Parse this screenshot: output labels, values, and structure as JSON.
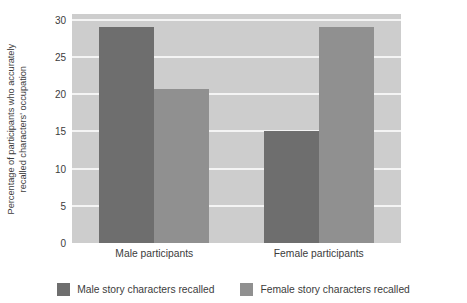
{
  "chart_data": {
    "type": "bar",
    "title": "",
    "xlabel": "",
    "ylabel_line1": "Percentage of participants who accurately",
    "ylabel_line2": "recalled characters' occupation",
    "categories": [
      "Male participants",
      "Female participants"
    ],
    "series": [
      {
        "name": "Male story characters recalled",
        "values": [
          29,
          15
        ],
        "color": "#6e6e6e"
      },
      {
        "name": "Female story characters recalled",
        "values": [
          20.7,
          29
        ],
        "color": "#909090"
      }
    ],
    "ylim": [
      0,
      30.8
    ],
    "yticks": [
      0,
      5,
      10,
      15,
      20,
      25,
      30
    ],
    "ytick_labels": [
      "0",
      "5",
      "10",
      "15",
      "20",
      "25",
      "30"
    ],
    "grid": true,
    "grid_axis": "y",
    "legend_position": "bottom",
    "plot_background": "#cdcdcd",
    "gridline_color": "#f4f4f4",
    "figure_background": "#ffffff"
  }
}
